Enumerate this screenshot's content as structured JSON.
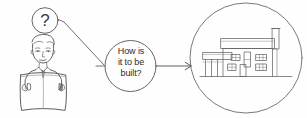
{
  "diagram": {
    "title": "How is it to be built?",
    "type": "hand-drawn concept sketch",
    "background_color": "#fefefe",
    "ink_color": "#4a4a4a",
    "text_color": "#2b2b2b"
  },
  "thought_bubble": {
    "name": "question-mark-bubble",
    "text": "?"
  },
  "person": {
    "name": "person-reading-document",
    "description": "man in suit and tie reading an open newspaper"
  },
  "speech_bubble": {
    "name": "question-bubble",
    "lines": [
      "How is",
      "it to be",
      "built?"
    ],
    "full_text": "How is it to be built?"
  },
  "connector": {
    "name": "thought-connector-line",
    "label": ""
  },
  "arrow": {
    "name": "arrow-to-answer",
    "label": "",
    "direction": "right"
  },
  "answer_circle": {
    "name": "house-illustration-circle",
    "content": "house elevation drawing",
    "description": "two-storey house with chimney, pitched roof, windows, door and carport"
  }
}
